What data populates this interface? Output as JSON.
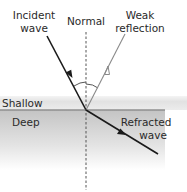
{
  "diagram": {
    "labels": {
      "incident_line1": "Incident",
      "incident_line2": "wave",
      "normal": "Normal",
      "reflection_line1": "Weak",
      "reflection_line2": "reflection",
      "shallow": "Shallow",
      "deep": "Deep",
      "refracted_line1": "Refracted",
      "refracted_line2": "wave"
    },
    "colors": {
      "incident_ray": "#1a1a1a",
      "reflected_ray": "#8a8a8a",
      "refracted_ray": "#1a1a1a",
      "normal_line": "#555555",
      "boundary": "#8f8f8f",
      "shallow_band": "#e6e6e6",
      "deep_top": "#c4c4c4",
      "deep_bottom": "#ffffff"
    }
  }
}
